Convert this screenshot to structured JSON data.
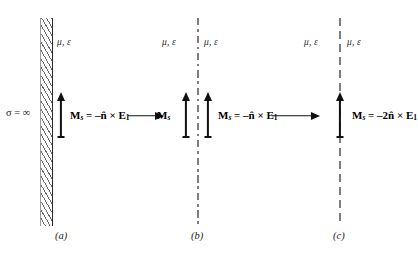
{
  "figure": {
    "background_color": "#ffffff",
    "ink_color": "#111111",
    "interface_line_color": "#7d7d84",
    "hatch_color": "#6c6c6c"
  },
  "panels": [
    {
      "id": "a",
      "caption": "(a)",
      "boundary_type": "hatched-conductor-wall",
      "conductivity_label": "σ = ∞",
      "media_labels": [
        "μ, ε"
      ],
      "arrows_vertical": 1,
      "equation": {
        "lhs_symbol": "M",
        "lhs_subscript": "s",
        "equals": "=",
        "rhs_sign": "–",
        "rhs_coefficient": "",
        "normal_symbol": "n̂",
        "cross": "×",
        "field_symbol": "E",
        "field_subscript": "1",
        "plain": "Mₛ = –n̂ × E₁"
      },
      "propagation_arrow": true
    },
    {
      "id": "b",
      "caption": "(b)",
      "boundary_type": "dash-dot-interface",
      "conductivity_label": "",
      "media_labels": [
        "μ, ε",
        "μ, ε"
      ],
      "arrows_vertical": 2,
      "left_label": {
        "lhs_symbol": "M",
        "lhs_subscript": "s",
        "plain": "Mₛ"
      },
      "equation": {
        "lhs_symbol": "M",
        "lhs_subscript": "s",
        "equals": "=",
        "rhs_sign": "–",
        "rhs_coefficient": "",
        "normal_symbol": "n̂",
        "cross": "×",
        "field_symbol": "E",
        "field_subscript": "1",
        "plain": "Mₛ = –n̂ × E₁"
      },
      "propagation_arrow": true
    },
    {
      "id": "c",
      "caption": "(c)",
      "boundary_type": "dashed-interface",
      "conductivity_label": "",
      "media_labels": [
        "μ, ε",
        "μ, ε"
      ],
      "arrows_vertical": 1,
      "equation": {
        "lhs_symbol": "M",
        "lhs_subscript": "s",
        "equals": "=",
        "rhs_sign": "–",
        "rhs_coefficient": "2",
        "normal_symbol": "n̂",
        "cross": "×",
        "field_symbol": "E",
        "field_subscript": "1",
        "plain": "Mₛ = –2n̂ × E₁"
      },
      "propagation_arrow": false
    }
  ],
  "symbols": {
    "mu": "μ",
    "epsilon": "ε",
    "sigma": "σ",
    "infinity": "∞",
    "comma": ",",
    "equals": "=",
    "minus": "–",
    "cross": "×",
    "n_hat": "n̂",
    "two": "2"
  }
}
